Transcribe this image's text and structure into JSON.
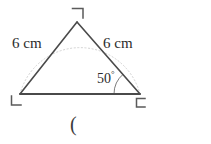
{
  "figure": {
    "type": "geometry-diagram",
    "shape": "isosceles-triangle",
    "background_color": "#ffffff",
    "stroke_color": "#4a4a4a",
    "arc_color": "#cfcfcf",
    "text_color": "#2b2b2b",
    "labels": {
      "left_side": "6 cm",
      "right_side": "6 cm",
      "angle_value": "50",
      "angle_degree_symbol": "°",
      "caption": "("
    },
    "vertices": {
      "apex": {
        "name": "apex-vertex",
        "x": 77,
        "y": 22,
        "marker": "corner-bracket-top"
      },
      "bottom_left": {
        "name": "bottom-left-vertex",
        "x": 20,
        "y": 94,
        "marker": "corner-bracket-left"
      },
      "bottom_right": {
        "name": "bottom-right-vertex",
        "x": 140,
        "y": 94,
        "marker": "corner-bracket-right"
      }
    },
    "angle_arc": {
      "at_vertex": "bottom_right",
      "radius": 26,
      "measure_degrees": 50
    },
    "dotted_arc": {
      "description": "faint dotted circular arc through the three vertices",
      "center_x": 80,
      "center_y": 96,
      "radius": 62
    }
  }
}
